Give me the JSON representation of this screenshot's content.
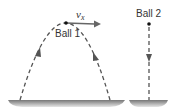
{
  "diagram": {
    "ball1": {
      "label": "Ball 1",
      "velocity_label": "v",
      "velocity_subscript": "x"
    },
    "ball2": {
      "label": "Ball 2"
    },
    "colors": {
      "line": "#555555",
      "ground_top": "#7a7a7a",
      "ground_bottom": "#d8d8d8",
      "text": "#333333"
    }
  }
}
